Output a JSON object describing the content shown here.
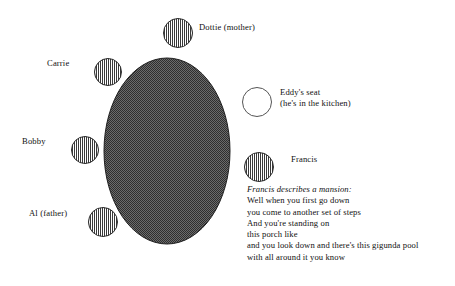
{
  "diagram": {
    "type": "seating-chart",
    "canvas": {
      "width": 455,
      "height": 286,
      "background": "#ffffff"
    },
    "table": {
      "name": "dining-table",
      "shape": "ellipse",
      "cx": 167,
      "cy": 151,
      "rx": 63,
      "ry": 93,
      "fill_pattern": "50-percent-checkerboard-dither",
      "fill_color": "#4d4d4d",
      "stroke_color": "#1a1a1a"
    },
    "seats": [
      {
        "id": "dottie",
        "label": "Dottie (mother)",
        "occupied": true,
        "fill_pattern": "vertical-hatch",
        "cx": 178,
        "cy": 33,
        "r": 15,
        "label_x": 199,
        "label_y": 27
      },
      {
        "id": "carrie",
        "label": "Carrie",
        "occupied": true,
        "fill_pattern": "vertical-hatch",
        "cx": 108,
        "cy": 72,
        "r": 14,
        "label_x": 47,
        "label_y": 63
      },
      {
        "id": "eddy",
        "label": "Eddy's seat",
        "sublabel": "(he's in the kitchen)",
        "occupied": false,
        "fill_pattern": "empty-white",
        "cx": 257,
        "cy": 102,
        "r": 15,
        "label_x": 280,
        "label_y": 92
      },
      {
        "id": "bobby",
        "label": "Bobby",
        "occupied": true,
        "fill_pattern": "vertical-hatch",
        "cx": 85,
        "cy": 150,
        "r": 14,
        "label_x": 22,
        "label_y": 141
      },
      {
        "id": "francis",
        "label": "Francis",
        "occupied": true,
        "fill_pattern": "vertical-hatch",
        "cx": 259,
        "cy": 167,
        "r": 15,
        "label_x": 291,
        "label_y": 159
      },
      {
        "id": "al",
        "label": "Al (father)",
        "occupied": true,
        "fill_pattern": "vertical-hatch",
        "cx": 103,
        "cy": 222,
        "r": 15,
        "label_x": 29,
        "label_y": 213
      }
    ]
  },
  "narrative": {
    "heading": "Francis describes a mansion:",
    "lines": [
      "Well when you first go down",
      "you come to another set of steps",
      "And you're standing on",
      "this porch like",
      "and you look down and there's this gigunda pool",
      "with all around it you know"
    ]
  }
}
